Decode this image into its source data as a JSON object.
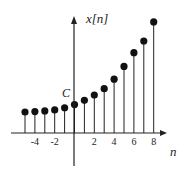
{
  "chart_data": {
    "type": "stem",
    "title": "",
    "xlabel": "n",
    "ylabel": "x[n]",
    "annotations": [
      {
        "text": "C",
        "position": "y-axis intercept at n=0"
      }
    ],
    "x": [
      -5,
      -4,
      -3,
      -2,
      -1,
      0,
      1,
      2,
      3,
      4,
      5,
      6,
      7,
      8
    ],
    "values": [
      1.0,
      1.02,
      1.05,
      1.1,
      1.2,
      1.35,
      1.55,
      1.8,
      2.1,
      2.55,
      3.15,
      3.8,
      4.35,
      5.25
    ],
    "x_tick_labels": [
      "-4",
      "-2",
      "2",
      "4",
      "6",
      "8"
    ],
    "x_ticks": [
      -4,
      -2,
      2,
      4,
      6,
      8
    ],
    "grid": false,
    "legend": null,
    "marker": "filled-circle",
    "colors": {
      "stem": "#222222",
      "marker": "#111111",
      "axis": "#222222"
    }
  },
  "labels": {
    "y_axis": "x[n]",
    "x_axis": "n",
    "intercept": "C"
  }
}
